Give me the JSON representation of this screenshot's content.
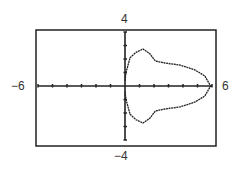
{
  "chart_data": {
    "type": "line",
    "title": "",
    "xlabel": "",
    "ylabel": "",
    "xlim": [
      -6,
      6
    ],
    "ylim": [
      -4,
      4
    ],
    "tick_labels": {
      "xmin": "−6",
      "xmax": "6",
      "ymin": "−4",
      "ymax": "4"
    },
    "x_ticks": [
      -6,
      -5,
      -4,
      -3,
      -2,
      -1,
      1,
      2,
      3,
      4,
      5,
      6
    ],
    "y_ticks": [
      -4,
      -3,
      -2,
      -1,
      1,
      2,
      3,
      4
    ],
    "grid": false,
    "series": [
      {
        "name": "closed curve (symmetric about x-axis)",
        "x": [
          0.0,
          0.07,
          0.35,
          0.76,
          1.24,
          1.7,
          2.1,
          2.76,
          3.8,
          4.8,
          5.5,
          5.9,
          5.5,
          4.8,
          3.8,
          2.76,
          2.1,
          1.7,
          1.24,
          0.76,
          0.35,
          0.07,
          0.0
        ],
        "y": [
          0.4,
          1.0,
          2.1,
          2.5,
          2.74,
          2.4,
          1.85,
          1.7,
          1.55,
          1.2,
          0.75,
          0.0,
          -0.75,
          -1.2,
          -1.55,
          -1.7,
          -1.85,
          -2.4,
          -2.74,
          -2.5,
          -2.1,
          -1.0,
          -0.4
        ]
      }
    ]
  }
}
